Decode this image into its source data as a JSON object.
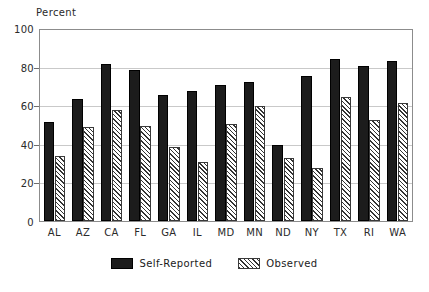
{
  "chart_data": {
    "type": "bar",
    "title": "",
    "xlabel": "",
    "ylabel": "Percent",
    "ylim": [
      0,
      100
    ],
    "yticks": [
      0,
      20,
      40,
      60,
      80,
      100
    ],
    "grid": true,
    "legend_position": "bottom-center",
    "categories": [
      "AL",
      "AZ",
      "CA",
      "FL",
      "GA",
      "IL",
      "MD",
      "MN",
      "ND",
      "NY",
      "TX",
      "RI",
      "WA"
    ],
    "series": [
      {
        "name": "Self-Reported",
        "color": "#1c1c1c",
        "pattern": "solid",
        "values": [
          52,
          64,
          82,
          79,
          66,
          68,
          71,
          73,
          40,
          76,
          85,
          81,
          84
        ]
      },
      {
        "name": "Observed",
        "color": "#333333",
        "pattern": "diagonal-hatch",
        "values": [
          34,
          49,
          58,
          50,
          39,
          31,
          51,
          60,
          33,
          28,
          65,
          53,
          62
        ]
      }
    ]
  },
  "axis": {
    "y_title": "Percent",
    "y_tick_labels": [
      "0",
      "20",
      "40",
      "60",
      "80",
      "100"
    ],
    "x_tick_labels": [
      "AL",
      "AZ",
      "CA",
      "FL",
      "GA",
      "IL",
      "MD",
      "MN",
      "ND",
      "NY",
      "TX",
      "RI",
      "WA"
    ]
  },
  "legend": {
    "items": [
      {
        "label": "Self-Reported"
      },
      {
        "label": "Observed"
      }
    ]
  }
}
